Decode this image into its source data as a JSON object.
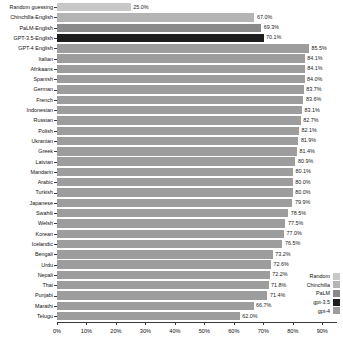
{
  "chart_data": {
    "type": "bar",
    "orientation": "horizontal",
    "title": "",
    "xlabel": "",
    "ylabel": "",
    "xlim": [
      0,
      95
    ],
    "xticks": [
      "0%",
      "10%",
      "20%",
      "30%",
      "40%",
      "50%",
      "60%",
      "70%",
      "80%",
      "90%"
    ],
    "xtick_values": [
      0,
      10,
      20,
      30,
      40,
      50,
      60,
      70,
      80,
      90
    ],
    "grid": false,
    "legend_position": "bottom-right",
    "categories": [
      "Random guessing",
      "Chinchilla-English",
      "PaLM-English",
      "GPT-3.5-English",
      "GPT-4 English",
      "Italian",
      "Afrikaans",
      "Spanish",
      "German",
      "French",
      "Indonesian",
      "Russian",
      "Polish",
      "Ukranian",
      "Greek",
      "Latvian",
      "Mandarin",
      "Arabic",
      "Turkish",
      "Japanese",
      "Swahili",
      "Welsh",
      "Korean",
      "Icelandic",
      "Bengali",
      "Urdu",
      "Nepali",
      "Thai",
      "Punjabi",
      "Marathi",
      "Telugu"
    ],
    "values": [
      25.0,
      67.0,
      69.3,
      70.1,
      85.5,
      84.1,
      84.1,
      84.0,
      83.7,
      83.6,
      83.1,
      82.7,
      82.1,
      81.9,
      81.4,
      80.9,
      80.1,
      80.0,
      80.0,
      79.9,
      78.5,
      77.5,
      77.0,
      76.5,
      73.2,
      72.6,
      72.2,
      71.8,
      71.4,
      66.7,
      62.0
    ],
    "value_labels": [
      "25.0%",
      "67.0%",
      "69.3%",
      "70.1%",
      "85.5%",
      "84.1%",
      "84.1%",
      "84.0%",
      "83.7%",
      "83.6%",
      "83.1%",
      "82.7%",
      "82.1%",
      "81.9%",
      "81.4%",
      "80.9%",
      "80.1%",
      "80.0%",
      "80.0%",
      "79.9%",
      "78.5%",
      "77.5%",
      "77.0%",
      "76.5%",
      "73.2%",
      "72.6%",
      "72.2%",
      "71.8%",
      "71.4%",
      "66.7%",
      "62.0%"
    ],
    "series_of_bar": [
      "Random",
      "Chinchilla",
      "PaLM",
      "gpt-3.5",
      "gpt-4",
      "gpt-4",
      "gpt-4",
      "gpt-4",
      "gpt-4",
      "gpt-4",
      "gpt-4",
      "gpt-4",
      "gpt-4",
      "gpt-4",
      "gpt-4",
      "gpt-4",
      "gpt-4",
      "gpt-4",
      "gpt-4",
      "gpt-4",
      "gpt-4",
      "gpt-4",
      "gpt-4",
      "gpt-4",
      "gpt-4",
      "gpt-4",
      "gpt-4",
      "gpt-4",
      "gpt-4",
      "gpt-4",
      "gpt-4"
    ],
    "legend": [
      {
        "label": "Random",
        "color": "#c8c8c8"
      },
      {
        "label": "Chinchilla",
        "color": "#b4b4b4"
      },
      {
        "label": "PaLM",
        "color": "#8a8a8a"
      },
      {
        "label": "gpt-3.5",
        "color": "#1e1e1e"
      },
      {
        "label": "gpt-4",
        "color": "#9d9d9d"
      }
    ],
    "series_colors": {
      "Random": "#c8c8c8",
      "Chinchilla": "#b4b4b4",
      "PaLM": "#8a8a8a",
      "gpt-3.5": "#1e1e1e",
      "gpt-4": "#9d9d9d"
    }
  }
}
